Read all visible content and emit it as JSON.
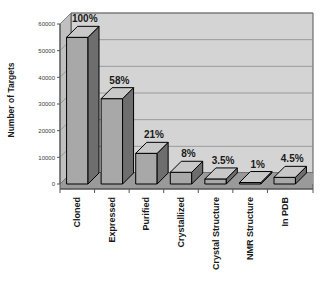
{
  "chart_data": {
    "type": "bar",
    "title": "",
    "xlabel": "",
    "ylabel": "Number of Targets",
    "categories": [
      "Cloned",
      "Expressed",
      "Purified",
      "Crystallized",
      "Crystal Structure",
      "NMR Structure",
      "In PDB"
    ],
    "values": [
      55000,
      32000,
      11500,
      4400,
      1900,
      550,
      2500
    ],
    "data_labels": [
      "100%",
      "58%",
      "21%",
      "8%",
      "3.5%",
      "1%",
      "4.5%"
    ],
    "ylim": [
      0,
      60000
    ],
    "yticks": [
      0,
      10000,
      20000,
      30000,
      40000,
      50000,
      60000
    ],
    "ytick_labels": [
      "0",
      "10000",
      "20000",
      "30000",
      "40000",
      "50000",
      "60000"
    ],
    "grid": true,
    "legend": "none",
    "style": "3d-column",
    "colors": {
      "bar_front": "#a8a8a8",
      "bar_side": "#6e6e6e",
      "bar_top": "#c8c8c8",
      "bar_outline": "#000000",
      "wall_back": "#d4d4d4",
      "wall_side": "#c0c0c0",
      "floor": "#9a9a9a",
      "gridline": "#8c8c8c",
      "axis": "#555555",
      "text": "#1a1a1a",
      "background": "#ffffff"
    }
  }
}
